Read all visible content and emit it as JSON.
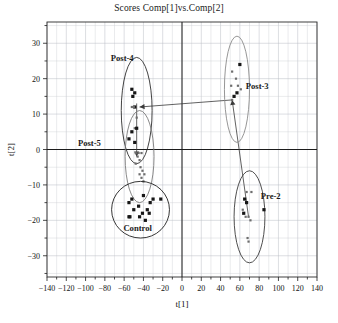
{
  "chart_data": {
    "type": "scatter",
    "title": "Scores Comp[1]vs.Comp[2]",
    "xlabel": "t[1]",
    "ylabel": "t[2]",
    "xlim": [
      -140,
      140
    ],
    "ylim": [
      -36,
      36
    ],
    "xticks": [
      -140,
      -120,
      -100,
      -80,
      -60,
      -40,
      -20,
      0,
      20,
      40,
      60,
      80,
      100,
      120,
      140
    ],
    "xtick_labels": [
      "-140",
      "-120",
      "-100",
      "-80",
      "-60",
      "-40",
      "-20",
      "0",
      "20",
      "40",
      "60",
      "80",
      "100",
      "120",
      "140"
    ],
    "yticks": [
      -30,
      -20,
      -10,
      0,
      10,
      20,
      30
    ],
    "ytick_labels": [
      "-30",
      "-20",
      "-10",
      "0",
      "10",
      "20",
      "30"
    ],
    "grid": true,
    "grid_x_step": 10,
    "grid_y_step": 5,
    "legend": "none",
    "marker_colors": {
      "filled_square": "#161616",
      "small_dot": "#6d6d6d"
    },
    "groups": [
      {
        "name": "Post-4",
        "label": "Post-4",
        "label_x": -62,
        "label_y": 25,
        "ellipse": {
          "cx": -47,
          "cy": 11,
          "rx": 16,
          "ry": 15,
          "rotation": 0,
          "color": "#2e2e2e"
        },
        "marker": "mixed",
        "points": [
          {
            "x": -52,
            "y": 17
          },
          {
            "x": -49,
            "y": 16
          },
          {
            "x": -51,
            "y": 15
          },
          {
            "x": -52,
            "y": 12
          },
          {
            "x": -49,
            "y": 12
          },
          {
            "x": -50,
            "y": 12
          },
          {
            "x": -47,
            "y": 9
          },
          {
            "x": -49,
            "y": 6
          },
          {
            "x": -47,
            "y": 6
          },
          {
            "x": -52,
            "y": 5
          },
          {
            "x": -55,
            "y": 3
          },
          {
            "x": -49,
            "y": 2
          }
        ]
      },
      {
        "name": "Post-5",
        "label": "Post-5",
        "label_x": -96,
        "label_y": 1,
        "ellipse": {
          "cx": -44,
          "cy": -2,
          "rx": 15,
          "ry": 13,
          "rotation": 0,
          "color": "#7a7a7a"
        },
        "marker": "dot",
        "points": [
          {
            "x": -48,
            "y": -1
          },
          {
            "x": -45,
            "y": -1
          },
          {
            "x": -42,
            "y": -1
          },
          {
            "x": -46,
            "y": -2
          },
          {
            "x": -44,
            "y": -3
          },
          {
            "x": -48,
            "y": -4
          },
          {
            "x": -43,
            "y": -5
          },
          {
            "x": -41,
            "y": -6
          },
          {
            "x": -44,
            "y": -7
          },
          {
            "x": -39,
            "y": -7
          },
          {
            "x": -42,
            "y": -8
          },
          {
            "x": -40,
            "y": -9
          }
        ]
      },
      {
        "name": "Control",
        "label": "Control",
        "label_x": -46,
        "label_y": -23,
        "ellipse": {
          "cx": -43,
          "cy": -17,
          "rx": 30,
          "ry": 8,
          "rotation": 0,
          "color": "#1f1f1f"
        },
        "marker": "square",
        "points": [
          {
            "x": -52,
            "y": -14
          },
          {
            "x": -40,
            "y": -13
          },
          {
            "x": -30,
            "y": -14
          },
          {
            "x": -22,
            "y": -14
          },
          {
            "x": -55,
            "y": -15
          },
          {
            "x": -45,
            "y": -16
          },
          {
            "x": -33,
            "y": -15
          },
          {
            "x": -50,
            "y": -17
          },
          {
            "x": -41,
            "y": -18
          },
          {
            "x": -36,
            "y": -17
          },
          {
            "x": -54,
            "y": -19
          },
          {
            "x": -44,
            "y": -19
          },
          {
            "x": -34,
            "y": -18
          },
          {
            "x": -55,
            "y": -19
          },
          {
            "x": -38,
            "y": -20
          }
        ]
      },
      {
        "name": "Post-3",
        "label": "Post-3",
        "label_x": 78,
        "label_y": 17,
        "ellipse": {
          "cx": 57,
          "cy": 17,
          "rx": 13,
          "ry": 15,
          "rotation": 0,
          "color": "#8a8a8a"
        },
        "marker": "mixed",
        "points": [
          {
            "x": 60,
            "y": 24
          },
          {
            "x": 52,
            "y": 22
          },
          {
            "x": 56,
            "y": 20
          },
          {
            "x": 51,
            "y": 18
          },
          {
            "x": 58,
            "y": 18
          },
          {
            "x": 61,
            "y": 17
          },
          {
            "x": 57,
            "y": 16
          },
          {
            "x": 54,
            "y": 15
          },
          {
            "x": 52,
            "y": 14
          }
        ]
      },
      {
        "name": "Pre-2",
        "label": "Pre-2",
        "label_x": 92,
        "label_y": -14,
        "ellipse": {
          "cx": 70,
          "cy": -19,
          "rx": 16,
          "ry": 13,
          "rotation": 0,
          "color": "#3a3a3a"
        },
        "marker": "mixed",
        "points": [
          {
            "x": 67,
            "y": -12
          },
          {
            "x": 72,
            "y": -12
          },
          {
            "x": 65,
            "y": -14
          },
          {
            "x": 67,
            "y": -15
          },
          {
            "x": 63,
            "y": -17
          },
          {
            "x": 85,
            "y": -17
          },
          {
            "x": 64,
            "y": -18
          },
          {
            "x": 66,
            "y": -19
          },
          {
            "x": 69,
            "y": -19
          },
          {
            "x": 71,
            "y": -20
          },
          {
            "x": 68,
            "y": -25
          },
          {
            "x": 69,
            "y": -26
          }
        ]
      }
    ],
    "connectors": [
      {
        "from": "Post-3",
        "to": "Post-4",
        "x1": 52,
        "y1": 14,
        "x2": -44,
        "y2": 12,
        "arrow": true
      },
      {
        "from": "Pre-2",
        "to": "Post-3",
        "x1": 69,
        "y1": -19,
        "x2": 52,
        "y2": 14,
        "arrow": true
      },
      {
        "from": "Post-4",
        "to": "Post-5",
        "x1": -47,
        "y1": 13,
        "x2": -47,
        "y2": -2,
        "arrow": true
      }
    ]
  },
  "caption": ""
}
